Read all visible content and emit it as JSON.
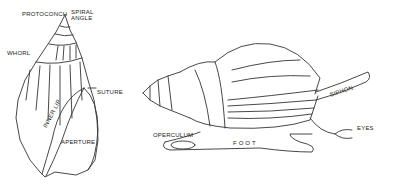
{
  "diagram": {
    "left_shell": {
      "labels": {
        "protoconch": "PROTOCONCH",
        "spiral": "SPIRAL",
        "angle": "ANGLE",
        "whorl": "WHORL",
        "suture": "SUTURE",
        "inner_lip": "INNER LIP",
        "aperture": "APERTURE"
      }
    },
    "right_snail": {
      "labels": {
        "siphon": "SIPHON",
        "eyes": "EYES",
        "operculum": "OPERCULUM",
        "foot": "FOOT"
      }
    },
    "colors": {
      "ink": "#222222",
      "background": "#ffffff"
    }
  }
}
